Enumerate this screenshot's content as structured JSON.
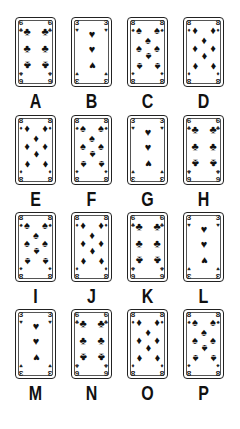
{
  "cards": [
    {
      "label": "A",
      "rank": "6",
      "suit": "clubs"
    },
    {
      "label": "B",
      "rank": "3",
      "suit": "hearts"
    },
    {
      "label": "C",
      "rank": "8",
      "suit": "spades"
    },
    {
      "label": "D",
      "rank": "8",
      "suit": "diamonds"
    },
    {
      "label": "E",
      "rank": "8",
      "suit": "diamonds"
    },
    {
      "label": "F",
      "rank": "8",
      "suit": "spades"
    },
    {
      "label": "G",
      "rank": "3",
      "suit": "hearts"
    },
    {
      "label": "H",
      "rank": "6",
      "suit": "clubs"
    },
    {
      "label": "I",
      "rank": "8",
      "suit": "spades"
    },
    {
      "label": "J",
      "rank": "8",
      "suit": "diamonds"
    },
    {
      "label": "K",
      "rank": "6",
      "suit": "clubs"
    },
    {
      "label": "L",
      "rank": "3",
      "suit": "hearts"
    },
    {
      "label": "M",
      "rank": "3",
      "suit": "hearts"
    },
    {
      "label": "N",
      "rank": "6",
      "suit": "clubs"
    },
    {
      "label": "O",
      "rank": "8",
      "suit": "diamonds"
    },
    {
      "label": "P",
      "rank": "8",
      "suit": "spades"
    }
  ],
  "suit_glyphs": {
    "clubs": "♣",
    "hearts": "♥",
    "spades": "♠",
    "diamonds": "♦"
  }
}
